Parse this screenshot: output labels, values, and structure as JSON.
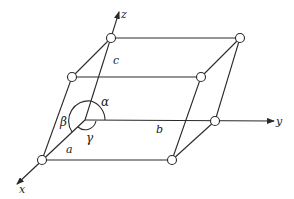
{
  "diagram": {
    "axes": {
      "x": {
        "label": "x"
      },
      "y": {
        "label": "y"
      },
      "z": {
        "label": "z"
      }
    },
    "edges": {
      "a": {
        "label": "a"
      },
      "b": {
        "label": "b"
      },
      "c": {
        "label": "c"
      }
    },
    "angles": {
      "alpha": {
        "label": "α"
      },
      "beta": {
        "label": "β"
      },
      "gamma": {
        "label": "γ"
      }
    },
    "colors": {
      "line": "#2a2a2a",
      "vertex_fill": "#ffffff",
      "background": "#ffffff"
    }
  }
}
